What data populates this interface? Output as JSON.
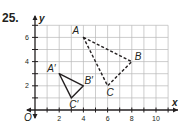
{
  "problem": {
    "number": "25."
  },
  "chart_data": {
    "type": "scatter",
    "title": "",
    "xlabel": "x",
    "ylabel": "y",
    "origin_label": "O",
    "xlim": [
      0,
      11
    ],
    "ylim": [
      0,
      7
    ],
    "grid": true,
    "x_ticks": [
      2,
      4,
      6,
      8,
      10
    ],
    "y_ticks": [
      2,
      4,
      6
    ],
    "series": [
      {
        "name": "Triangle ABC (preimage)",
        "style": "dashed",
        "points": [
          {
            "label": "A",
            "x": 4,
            "y": 6
          },
          {
            "label": "B",
            "x": 8,
            "y": 4
          },
          {
            "label": "C",
            "x": 6,
            "y": 2
          }
        ]
      },
      {
        "name": "Triangle A'B'C' (image)",
        "style": "solid",
        "points": [
          {
            "label": "A′",
            "x": 2,
            "y": 3
          },
          {
            "label": "B′",
            "x": 4,
            "y": 2
          },
          {
            "label": "C′",
            "x": 3,
            "y": 1
          }
        ]
      }
    ]
  },
  "colors": {
    "ink": "#231f20",
    "grid": "#b8b8b8"
  }
}
